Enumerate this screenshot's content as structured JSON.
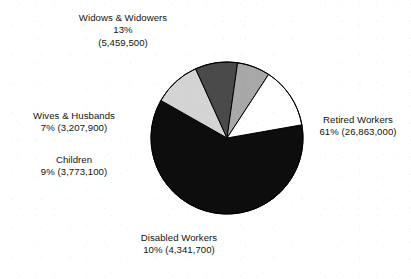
{
  "top_artifact": {
    "text": "· ··"
  },
  "chart_data": {
    "type": "pie",
    "title": "",
    "subtitle": "",
    "xlabel": "",
    "ylabel": "",
    "legend_position": "callout-labels",
    "grid": false,
    "total_value": 43645200,
    "center": {
      "x": 227,
      "y": 138
    },
    "radius": 76,
    "start_angle_deg": -10,
    "direction": "clockwise",
    "categories": [
      "Retired Workers",
      "Disabled Workers",
      "Children",
      "Wives & Husbands",
      "Widows & Widowers"
    ],
    "values": [
      26863000,
      4341700,
      3773100,
      3207900,
      5459500
    ],
    "percents": [
      61,
      10,
      9,
      7,
      13
    ],
    "colors": [
      "#0d0d0d",
      "#d4d4d4",
      "#4a4a4a",
      "#a8a8a8",
      "#ffffff"
    ],
    "stroke": "#000000",
    "stroke_width": 1,
    "slices": [
      {
        "name": "Retired Workers",
        "percent": 61,
        "value": 26863000,
        "value_text": "26,863,000",
        "percent_text": "61%",
        "color": "#0d0d0d"
      },
      {
        "name": "Disabled Workers",
        "percent": 10,
        "value": 4341700,
        "value_text": "4,341,700",
        "percent_text": "10%",
        "color": "#d4d4d4"
      },
      {
        "name": "Children",
        "percent": 9,
        "value": 3773100,
        "value_text": "3,773,100",
        "percent_text": "9%",
        "color": "#4a4a4a"
      },
      {
        "name": "Wives & Husbands",
        "percent": 7,
        "value": 3207900,
        "value_text": "3,207,900",
        "percent_text": "7%",
        "color": "#a8a8a8"
      },
      {
        "name": "Widows & Widowers",
        "percent": 13,
        "value": 5459500,
        "value_text": "5,459,500",
        "percent_text": "13%",
        "color": "#ffffff"
      }
    ]
  },
  "labels": {
    "widows": {
      "line1": "Widows & Widowers",
      "line2": "13%",
      "line3": "(5,459,500)"
    },
    "wives": {
      "line1": "Wives & Husbands",
      "line2": "7% (3,207,900)"
    },
    "children": {
      "line1": "Children",
      "line2": "9% (3,773,100)"
    },
    "retired": {
      "line1": "Retired Workers",
      "line2": "61% (26,863,000)"
    },
    "disabled": {
      "line1": "Disabled Workers",
      "line2": "10% (4,341,700)"
    }
  }
}
